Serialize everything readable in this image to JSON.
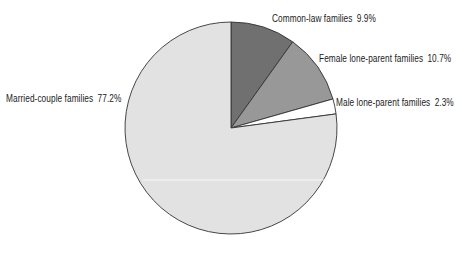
{
  "chart_data": {
    "type": "pie",
    "title": "",
    "start_angle_deg": 0,
    "direction": "clockwise",
    "slices": [
      {
        "label": "Common-law families",
        "value": 9.9,
        "display": "9.9%",
        "color": "#707070"
      },
      {
        "label": "Female lone-parent families",
        "value": 10.7,
        "display": "10.7%",
        "color": "#989898"
      },
      {
        "label": "Male lone-parent families",
        "value": 2.3,
        "display": "2.3%",
        "color": "#ffffff"
      },
      {
        "label": "Married-couple families",
        "value": 77.2,
        "display": "77.2%",
        "color": "#e2e2e2"
      }
    ],
    "legend": "none (direct labels)",
    "unit": "%"
  },
  "labels": [
    {
      "name": "Common-law families",
      "value": "9.9%"
    },
    {
      "name": "Female lone-parent families",
      "value": "10.7%"
    },
    {
      "name": "Male lone-parent families",
      "value": "2.3%"
    },
    {
      "name": "Married-couple families",
      "value": "77.2%"
    }
  ]
}
